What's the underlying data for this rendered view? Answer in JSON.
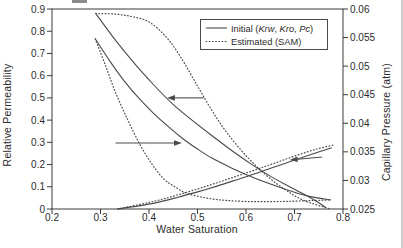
{
  "figure": {
    "background": "#ffffff",
    "frame_color": "#3a3a3a",
    "curve_color": "#4a4a4a",
    "text_color": "#2b2b2b"
  },
  "legend": {
    "row1": {
      "pre": "Initial (",
      "i1": "Krw",
      "s1": ", ",
      "i2": "Kro",
      "s2": ", ",
      "i3": "Pc",
      "post": ")"
    },
    "row2": {
      "label": "Estimated (SAM)"
    }
  },
  "axis_titles": {
    "x": "Water Saturation",
    "left": "Relative Permeability",
    "right": "Capillary Pressure (atm)"
  },
  "chart_data": {
    "type": "line",
    "title": "",
    "xlabel": "Water Saturation",
    "ylabel_left": "Relative Permeability",
    "ylabel_right": "Capillary Pressure (atm)",
    "xlim": [
      0.2,
      0.8
    ],
    "ylim_left": [
      0,
      0.9
    ],
    "ylim_right": [
      0.025,
      0.06
    ],
    "grid": false,
    "legend_position": "top-right",
    "legend_entries": [
      "Initial (Krw, Kro, Pc)",
      "Estimated (SAM)"
    ],
    "x_ticks": [
      {
        "label": "0.2",
        "value": 0.2
      },
      {
        "label": "0.3",
        "value": 0.3
      },
      {
        "label": "0.4",
        "value": 0.4
      },
      {
        "label": "0.5",
        "value": 0.5
      },
      {
        "label": "0.6",
        "value": 0.6
      },
      {
        "label": "0.7",
        "value": 0.7
      },
      {
        "label": "0.8",
        "value": 0.8
      }
    ],
    "left_ticks": [
      {
        "label": "0",
        "value": 0
      },
      {
        "label": "0.1",
        "value": 0.1
      },
      {
        "label": "0.2",
        "value": 0.2
      },
      {
        "label": "0.3",
        "value": 0.3
      },
      {
        "label": "0.4",
        "value": 0.4
      },
      {
        "label": "0.5",
        "value": 0.5
      },
      {
        "label": "0.6",
        "value": 0.6
      },
      {
        "label": "0.7",
        "value": 0.7
      },
      {
        "label": "0.8",
        "value": 0.8
      },
      {
        "label": "0.9",
        "value": 0.9
      }
    ],
    "right_ticks": [
      {
        "label": "0.025",
        "value": 0.025
      },
      {
        "label": "0.03",
        "value": 0.03
      },
      {
        "label": "0.035",
        "value": 0.035
      },
      {
        "label": "0.04",
        "value": 0.04
      },
      {
        "label": "0.045",
        "value": 0.045
      },
      {
        "label": "0.05",
        "value": 0.05
      },
      {
        "label": "0.055",
        "value": 0.055
      },
      {
        "label": "0.06",
        "value": 0.06
      }
    ],
    "series": [
      {
        "id": "kro-initial",
        "name": "Kro initial",
        "style": "solid",
        "axis": "left",
        "points": [
          [
            0.29,
            0.88
          ],
          [
            0.33,
            0.762
          ],
          [
            0.37,
            0.655
          ],
          [
            0.41,
            0.558
          ],
          [
            0.45,
            0.47
          ],
          [
            0.49,
            0.398
          ],
          [
            0.53,
            0.33
          ],
          [
            0.57,
            0.264
          ],
          [
            0.61,
            0.203
          ],
          [
            0.65,
            0.148
          ],
          [
            0.69,
            0.1
          ],
          [
            0.72,
            0.066
          ],
          [
            0.75,
            0.028
          ],
          [
            0.765,
            0.005
          ]
        ]
      },
      {
        "id": "kro-estimated",
        "name": "Kro estimated (SAM)",
        "style": "dotted",
        "axis": "left",
        "points": [
          [
            0.29,
            0.88
          ],
          [
            0.33,
            0.877
          ],
          [
            0.365,
            0.866
          ],
          [
            0.4,
            0.842
          ],
          [
            0.435,
            0.775
          ],
          [
            0.465,
            0.685
          ],
          [
            0.5,
            0.553
          ],
          [
            0.53,
            0.443
          ],
          [
            0.56,
            0.345
          ],
          [
            0.6,
            0.24
          ],
          [
            0.64,
            0.155
          ],
          [
            0.68,
            0.088
          ],
          [
            0.72,
            0.038
          ],
          [
            0.775,
            0.0
          ]
        ]
      },
      {
        "id": "krw-initial",
        "name": "Krw initial",
        "style": "solid",
        "axis": "left",
        "points": [
          [
            0.335,
            0.0
          ],
          [
            0.38,
            0.014
          ],
          [
            0.42,
            0.031
          ],
          [
            0.46,
            0.053
          ],
          [
            0.5,
            0.077
          ],
          [
            0.54,
            0.103
          ],
          [
            0.58,
            0.131
          ],
          [
            0.62,
            0.16
          ],
          [
            0.66,
            0.19
          ],
          [
            0.7,
            0.22
          ],
          [
            0.74,
            0.25
          ],
          [
            0.777,
            0.276
          ]
        ]
      },
      {
        "id": "krw-estimated",
        "name": "Krw estimated (SAM)",
        "style": "dotted",
        "axis": "left",
        "points": [
          [
            0.335,
            0.0
          ],
          [
            0.38,
            0.02
          ],
          [
            0.42,
            0.04
          ],
          [
            0.46,
            0.064
          ],
          [
            0.5,
            0.09
          ],
          [
            0.54,
            0.118
          ],
          [
            0.58,
            0.147
          ],
          [
            0.62,
            0.177
          ],
          [
            0.66,
            0.207
          ],
          [
            0.7,
            0.238
          ],
          [
            0.74,
            0.266
          ],
          [
            0.78,
            0.288
          ]
        ]
      },
      {
        "id": "pc-initial",
        "name": "Pc initial",
        "style": "solid",
        "axis": "right",
        "points": [
          [
            0.289,
            0.0548
          ],
          [
            0.32,
            0.0508
          ],
          [
            0.35,
            0.0473
          ],
          [
            0.38,
            0.0443
          ],
          [
            0.41,
            0.0417
          ],
          [
            0.44,
            0.0394
          ],
          [
            0.47,
            0.0373
          ],
          [
            0.5,
            0.0355
          ],
          [
            0.53,
            0.0339
          ],
          [
            0.57,
            0.0322
          ],
          [
            0.61,
            0.0307
          ],
          [
            0.65,
            0.0294
          ],
          [
            0.69,
            0.0282
          ],
          [
            0.73,
            0.0272
          ],
          [
            0.775,
            0.0266
          ]
        ]
      },
      {
        "id": "pc-estimated",
        "name": "Pc estimated (SAM)",
        "style": "dotted",
        "axis": "right",
        "points": [
          [
            0.289,
            0.0548
          ],
          [
            0.31,
            0.0502
          ],
          [
            0.33,
            0.0456
          ],
          [
            0.355,
            0.0408
          ],
          [
            0.38,
            0.0365
          ],
          [
            0.405,
            0.033
          ],
          [
            0.43,
            0.0303
          ],
          [
            0.455,
            0.0288
          ],
          [
            0.48,
            0.0277
          ],
          [
            0.52,
            0.0269
          ],
          [
            0.56,
            0.0265
          ],
          [
            0.61,
            0.0263
          ],
          [
            0.66,
            0.0263
          ],
          [
            0.71,
            0.0264
          ],
          [
            0.775,
            0.0266
          ]
        ]
      }
    ],
    "annotations": [
      {
        "type": "arrow",
        "axis": "left",
        "from": [
          0.513,
          0.5
        ],
        "to": [
          0.437,
          0.5
        ]
      },
      {
        "type": "arrow",
        "axis": "left",
        "from": [
          0.331,
          0.297
        ],
        "to": [
          0.468,
          0.297
        ]
      },
      {
        "type": "arrow",
        "axis": "left",
        "from": [
          0.757,
          0.234
        ],
        "to": [
          0.69,
          0.221
        ]
      }
    ]
  }
}
